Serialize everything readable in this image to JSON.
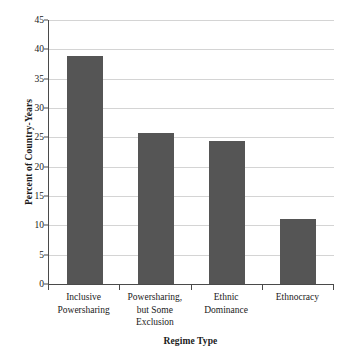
{
  "chart_data": {
    "type": "bar",
    "title": "",
    "xlabel": "Regime Type",
    "ylabel": "Percent of Country-Years",
    "categories": [
      "Inclusive Powersharing",
      "Powersharing, but Some Exclusion",
      "Ethnic Dominance",
      "Ethnocracy"
    ],
    "category_lines": [
      [
        "Inclusive",
        "Powersharing"
      ],
      [
        "Powersharing,",
        "but Some",
        "Exclusion"
      ],
      [
        "Ethnic",
        "Dominance"
      ],
      [
        "Ethnocracy"
      ]
    ],
    "values": [
      38.8,
      25.7,
      24.3,
      11.0
    ],
    "ylim": [
      0,
      45
    ],
    "ytick_labels": [
      "0",
      "5",
      "10",
      "15",
      "20",
      "25",
      "30",
      "35",
      "40",
      "45"
    ],
    "ytick_values": [
      0,
      5,
      10,
      15,
      20,
      25,
      30,
      35,
      40,
      45
    ],
    "grid": "horizontal",
    "legend": "none",
    "bar_color": "#555555",
    "grid_color": "#d4d4d4",
    "axis_color": "#4a4a4a"
  }
}
